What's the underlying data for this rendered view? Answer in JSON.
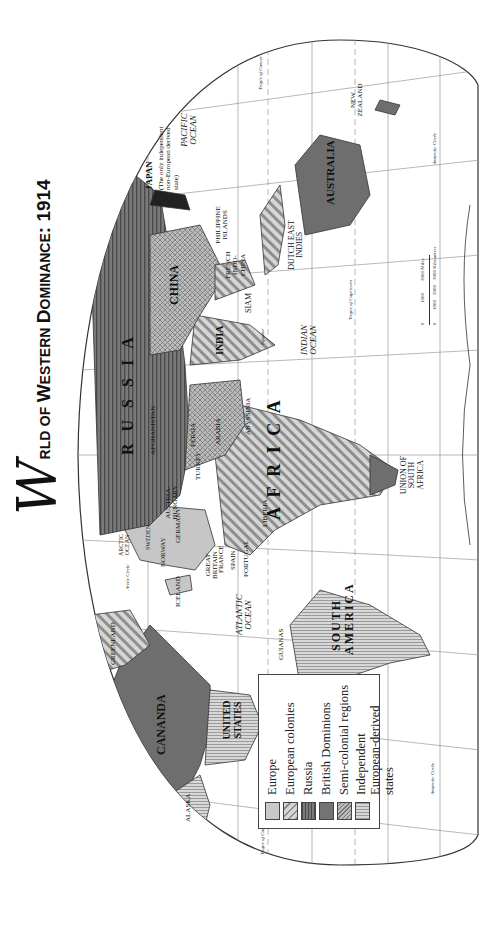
{
  "title": {
    "initial": "W",
    "word1_cap": "O",
    "word1": "RLD",
    "of": "OF",
    "w2_cap": "W",
    "w2": "ESTERN",
    "w3_cap": "D",
    "w3": "OMINANCE",
    "year": ": 1914"
  },
  "legend": {
    "items": [
      {
        "label": "Europe",
        "swatch": "europe"
      },
      {
        "label": "European colonies",
        "swatch": "colonies"
      },
      {
        "label": "Russia",
        "swatch": "russia"
      },
      {
        "label": "British Dominions",
        "swatch": "dominions"
      },
      {
        "label": "Semi-colonial regions",
        "swatch": "semicolonial"
      },
      {
        "label": "Independent European-derived states",
        "swatch": "independent"
      }
    ]
  },
  "colors": {
    "europe": "#c8c8c8",
    "colonies": "#bdbdbd",
    "russia": "#6d6d6d",
    "dominions": "#737373",
    "semicolonial": "#a9a9a9",
    "independent": "#cfcfcf",
    "ocean": "#ffffff",
    "grid": "#888888"
  },
  "labels": {
    "canada": "CANANDA",
    "alaska": "ALASKA",
    "greenland": "GREENLAND",
    "baffin": "BAFF.",
    "united_states": "UNITED STATES",
    "mexico": "MEXICO",
    "central_america": "CENTRAL AMERICA",
    "guianas": "GUIANAS",
    "south_america": "SOUTH AMERICA",
    "iceland": "ICELAND",
    "great_britain": "GREAT BRITAIN",
    "norway": "NORWAY",
    "sweden": "SWEDEN",
    "france": "FRANCE",
    "spain": "SPAIN",
    "portugal": "PORTUGAL",
    "germany": "GERMANY",
    "austria_hungary": "AUSTRIA-HUNGARY",
    "russia": "R U S S I A",
    "afghanistan": "AFGHANISTAN",
    "persia": "PERSIA",
    "arabia": "ARABIA",
    "turkey": "TURKEY",
    "africa": "A F R I C A",
    "abyssinia": "ABYSSINIA",
    "liberia": "LIBERIA",
    "union_south_africa": "UNION OF SOUTH AFRICA",
    "china": "CHINA",
    "india": "INDIA",
    "siam": "SIAM",
    "french_indochina": "FRENCH INDO-CHINA",
    "philippines": "PHILIPPINE ISLANDS",
    "japan": "JAPAN",
    "japan_note": "(The only independent non-European derived state)",
    "dutch_east_indies": "DUTCH EAST INDIES",
    "australia": "AUSTRALIA",
    "new_zealand": "NEW ZEALAND",
    "pacific_ocean_w": "PACIFIC OCEAN",
    "pacific_ocean_e": "PACIFIC OCEAN",
    "atlantic_ocean": "ATLANTIC OCEAN",
    "indian_ocean": "INDIAN OCEAN",
    "arctic_ocean": "ARCTIC OCEAN",
    "equator_w": "Equator",
    "equator_e": "Equator",
    "tropic_cancer_w": "Tropic of Cancer",
    "tropic_cancer_e": "Tropic of Cancer",
    "tropic_capricorn": "Tropic of Capricorn",
    "arctic_circle": "Arctic Circle",
    "antarctic_circle_w": "Antarctic Circle",
    "antarctic_circle_e": "Antarctic Circle"
  },
  "scale": {
    "miles": [
      "0",
      "1000",
      "2000 Miles"
    ],
    "km": [
      "0",
      "1000",
      "2000",
      "3000 Kilometers"
    ]
  }
}
